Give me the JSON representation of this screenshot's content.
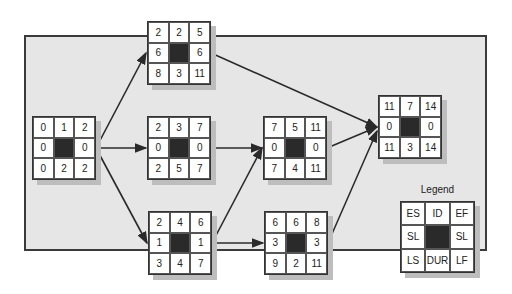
{
  "diagram": {
    "type": "network-diagram-critical-path",
    "colors": {
      "panel": "#e6e6e6",
      "border": "#3a3a3a",
      "critical_center": "#2a2a2a",
      "shadow": "#bdbdbd"
    },
    "nodes": [
      {
        "id": "start",
        "ES": "0",
        "ID": "1",
        "EF": "2",
        "SL_left": "0",
        "SL_right": "0",
        "LS": "0",
        "DUR": "2",
        "LF": "2"
      },
      {
        "id": "top",
        "ES": "2",
        "ID": "2",
        "EF": "5",
        "SL_left": "6",
        "SL_right": "6",
        "LS": "8",
        "DUR": "3",
        "LF": "11"
      },
      {
        "id": "mid",
        "ES": "2",
        "ID": "3",
        "EF": "7",
        "SL_left": "0",
        "SL_right": "0",
        "LS": "2",
        "DUR": "5",
        "LF": "7"
      },
      {
        "id": "bottom",
        "ES": "2",
        "ID": "4",
        "EF": "6",
        "SL_left": "1",
        "SL_right": "1",
        "LS": "3",
        "DUR": "4",
        "LF": "7"
      },
      {
        "id": "mid2",
        "ES": "7",
        "ID": "5",
        "EF": "11",
        "SL_left": "0",
        "SL_right": "0",
        "LS": "7",
        "DUR": "4",
        "LF": "11"
      },
      {
        "id": "bottom2",
        "ES": "6",
        "ID": "6",
        "EF": "8",
        "SL_left": "3",
        "SL_right": "3",
        "LS": "9",
        "DUR": "2",
        "LF": "11"
      },
      {
        "id": "end",
        "ES": "11",
        "ID": "7",
        "EF": "14",
        "SL_left": "0",
        "SL_right": "0",
        "LS": "11",
        "DUR": "3",
        "LF": "14"
      }
    ],
    "edges": [
      [
        "1",
        "2"
      ],
      [
        "1",
        "3"
      ],
      [
        "1",
        "4"
      ],
      [
        "2",
        "7"
      ],
      [
        "3",
        "5"
      ],
      [
        "4",
        "5"
      ],
      [
        "4",
        "6"
      ],
      [
        "5",
        "7"
      ],
      [
        "6",
        "7"
      ]
    ],
    "legend": {
      "title": "Legend",
      "ES": "ES",
      "ID": "ID",
      "EF": "EF",
      "SL_left": "SL",
      "SL_right": "SL",
      "LS": "LS",
      "DUR": "DUR",
      "LF": "LF"
    }
  }
}
